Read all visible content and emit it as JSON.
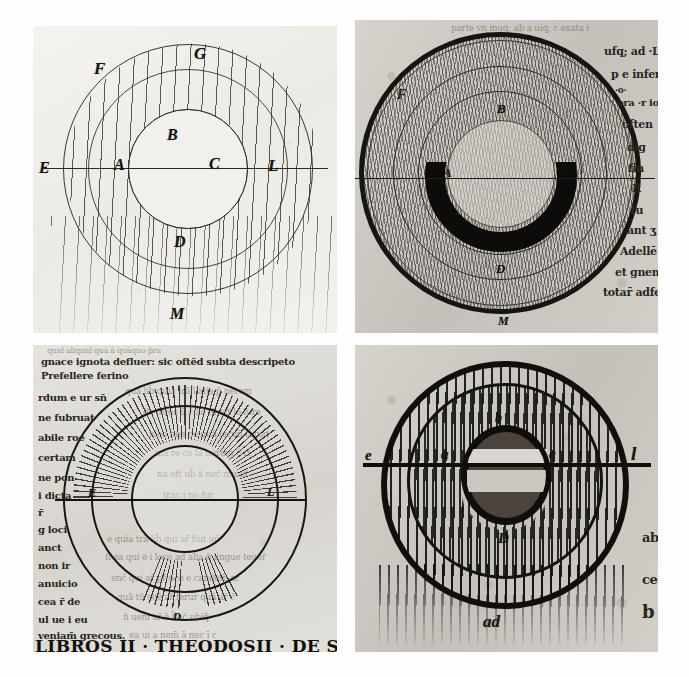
{
  "figure": {
    "layout": "2x2 grid of black-and-white photographic plates",
    "background_color": "#ffffff"
  },
  "panels": [
    {
      "id": "top-left",
      "caption": "Pen drawing: three concentric circles with vertical ruling lines and a horizontal diameter",
      "parchment": "light",
      "labels": [
        {
          "text": "F",
          "x": 20,
          "y": 11
        },
        {
          "text": "G",
          "x": 53,
          "y": 6
        },
        {
          "text": "B",
          "x": 44,
          "y": 33
        },
        {
          "text": "E",
          "x": 2,
          "y": 50
        },
        {
          "text": "A",
          "x": 26,
          "y": 48
        },
        {
          "text": "C",
          "x": 57,
          "y": 48
        },
        {
          "text": "L",
          "x": 76,
          "y": 48
        },
        {
          "text": "D",
          "x": 46,
          "y": 70
        },
        {
          "text": "M",
          "x": 45,
          "y": 95
        }
      ],
      "marginalia": []
    },
    {
      "id": "top-right",
      "caption": "Heavily inked wheel: stippled annulus, dark lower half ring, marginal Latin text at right",
      "parchment": "grey",
      "labels": [
        {
          "text": "F",
          "x": 16,
          "y": 24
        },
        {
          "text": "B",
          "x": 48,
          "y": 30
        },
        {
          "text": "A",
          "x": 30,
          "y": 54
        },
        {
          "text": "C",
          "x": 69,
          "y": 53
        },
        {
          "text": "D",
          "x": 48,
          "y": 80
        },
        {
          "text": "M",
          "x": 49,
          "y": 98
        }
      ],
      "marginalia": [
        {
          "text": "parte vn inuq; ab a uiq; c exata i",
          "x": 32,
          "y": 2,
          "size": 9,
          "faint": true
        },
        {
          "text": "ufq; ad ·L· hu",
          "x": 84,
          "y": 9,
          "size": 11,
          "faint": false
        },
        {
          "text": "p e inferio",
          "x": 86,
          "y": 17,
          "size": 11,
          "faint": false
        },
        {
          "text": "·o·",
          "x": 87,
          "y": 22,
          "size": 9,
          "faint": false
        },
        {
          "text": "ora ·r io",
          "x": 88,
          "y": 26,
          "size": 10,
          "faint": false
        },
        {
          "text": "often",
          "x": 90,
          "y": 33,
          "size": 11,
          "faint": false
        },
        {
          "text": "dig",
          "x": 92,
          "y": 41,
          "size": 11,
          "faint": false
        },
        {
          "text": "fin",
          "x": 92,
          "y": 48,
          "size": 11,
          "faint": false
        },
        {
          "text": "R",
          "x": 93,
          "y": 55,
          "size": 11,
          "faint": false
        },
        {
          "text": "fu",
          "x": 93,
          "y": 62,
          "size": 11,
          "faint": false
        },
        {
          "text": "ant ʒ",
          "x": 92,
          "y": 69,
          "size": 11,
          "faint": false
        },
        {
          "text": "Adellē",
          "x": 89,
          "y": 76,
          "size": 11,
          "faint": false
        },
        {
          "text": "et gnem",
          "x": 88,
          "y": 83,
          "size": 11,
          "faint": false
        },
        {
          "text": "totar̄ adfect̄",
          "x": 84,
          "y": 90,
          "size": 11,
          "faint": false
        }
      ]
    },
    {
      "id": "bottom-left",
      "caption": "Wheel drawn over a written page: radiating hatch bands, horizontal diameter, gothic caption below",
      "parchment": "mid",
      "labels": [
        {
          "text": "E",
          "x": 20,
          "y": 56
        },
        {
          "text": "L",
          "x": 78,
          "y": 55
        },
        {
          "text": "D",
          "x": 47,
          "y": 88
        }
      ],
      "marginalia": [
        {
          "text": "quid aliquid  quā ā quāquo p̄ru",
          "x": 6,
          "y": 2,
          "size": 8,
          "faint": true
        },
        {
          "text": "gnace ignota defluer: sic oftēd subta descripeto",
          "x": 4,
          "y": 7,
          "size": 10,
          "faint": false
        },
        {
          "text": "Prefellere ferino",
          "x": 4,
          "y": 13,
          "size": 10,
          "faint": false
        },
        {
          "text": "rdum e ur sn̄",
          "x": 4,
          "y": 22,
          "size": 10,
          "faint": false
        },
        {
          "text": "ne fubruat",
          "x": 4,
          "y": 29,
          "size": 10,
          "faint": false
        },
        {
          "text": "abile roe",
          "x": 4,
          "y": 36,
          "size": 10,
          "faint": false
        },
        {
          "text": "certam",
          "x": 4,
          "y": 43,
          "size": 10,
          "faint": false
        },
        {
          "text": "ne pon",
          "x": 4,
          "y": 50,
          "size": 10,
          "faint": false
        },
        {
          "text": "i dicta",
          "x": 4,
          "y": 56,
          "size": 10,
          "faint": false
        },
        {
          "text": "r̄",
          "x": 4,
          "y": 62,
          "size": 10,
          "faint": false
        },
        {
          "text": "g loci",
          "x": 4,
          "y": 69,
          "size": 10,
          "faint": false
        },
        {
          "text": "anct",
          "x": 4,
          "y": 75,
          "size": 10,
          "faint": false
        },
        {
          "text": "non ir",
          "x": 4,
          "y": 81,
          "size": 10,
          "faint": false
        },
        {
          "text": "anuicio",
          "x": 4,
          "y": 87,
          "size": 10,
          "faint": false
        },
        {
          "text": "cea r̄ de",
          "x": 4,
          "y": 92,
          "size": 10,
          "faint": false
        },
        {
          "text": "ul ue i eu",
          "x": 4,
          "y": 96,
          "size": 10,
          "faint": false
        }
      ],
      "caption_line": {
        "text": "veniam̄ grecous.",
        "x": 4,
        "y": 100,
        "size": 10
      },
      "gothic_caption": {
        "text": "LIBROS II · THEODOSII · DE SOM ·",
        "x": 3,
        "y": 105,
        "size": 17
      },
      "body_text_faint": [
        {
          "text": "quā lib̄ quia trā ī alia p̄ nerem",
          "x": 30,
          "y": 14
        },
        {
          "text": "de feres  ū c̄ āc tū eft lo fure",
          "x": 36,
          "y": 21
        },
        {
          "text": "ideo nee  oe quā lecun̄ tarqd",
          "x": 38,
          "y": 28
        },
        {
          "text": "am re  co la nurom c̄ ri",
          "x": 40,
          "y": 34
        },
        {
          "text": "na oft    ub̄ ā nec̄ mund",
          "x": 41,
          "y": 41
        },
        {
          "text": "trac  i no fur",
          "x": 43,
          "y": 48
        },
        {
          "text": "e quia trā lib̄ qui ar̄ fuit ap̄",
          "x": 24,
          "y": 62
        },
        {
          "text": "fi ea qui  e i loco ad alia q̄ lingue teuer̄",
          "x": 24,
          "y": 68
        },
        {
          "text": "enc̄ qui ar̄ pr̄ oce e candem̄ ar",
          "x": 26,
          "y": 75
        },
        {
          "text": "quā tū ocē ar̄ ferur quā ar̄ c̄",
          "x": 28,
          "y": 81
        },
        {
          "text": "n̄ ueni ar̄ ē t̄ ac̄ ubiq̄",
          "x": 30,
          "y": 88
        },
        {
          "text": "ea ui a nem̄ ā nec ī c",
          "x": 32,
          "y": 94
        }
      ]
    },
    {
      "id": "bottom-right",
      "caption": "Bold-ink wheel: thick outer ring, wavy hatch annulus, dark central disc with light band, labels e a b c l D ad",
      "parchment": "grey",
      "labels": [
        {
          "text": "e",
          "x": 3,
          "y": 45
        },
        {
          "text": "a",
          "x": 30,
          "y": 44
        },
        {
          "text": "b",
          "x": 48,
          "y": 26
        },
        {
          "text": "c",
          "x": 66,
          "y": 43
        },
        {
          "text": "l",
          "x": 92,
          "y": 43
        },
        {
          "text": "D",
          "x": 48,
          "y": 68
        },
        {
          "text": "ad",
          "x": 43,
          "y": 96
        }
      ],
      "marginalia": [
        {
          "text": "ab",
          "x": 95,
          "y": 62,
          "size": 12,
          "faint": false
        },
        {
          "text": "ce",
          "x": 95,
          "y": 76,
          "size": 12,
          "faint": false
        },
        {
          "text": "b",
          "x": 95,
          "y": 87,
          "size": 16,
          "faint": false
        }
      ]
    }
  ],
  "colors": {
    "ink": "#1b1a18",
    "parchment_light": "#efeeea",
    "parchment_grey": "#cdcac4",
    "page_background": "#ffffff"
  }
}
